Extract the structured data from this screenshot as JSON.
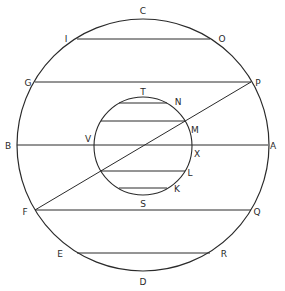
{
  "figure": {
    "outer_circle": {
      "cx": 143,
      "cy": 145,
      "r": 126
    },
    "inner_circle": {
      "cx": 143,
      "cy": 146,
      "r": 49
    },
    "stroke_color": "#2a2a2a",
    "chords": [
      {
        "name": "chord-IO",
        "x1": 77,
        "y1": 39,
        "x2": 210,
        "y2": 39
      },
      {
        "name": "chord-GP",
        "x1": 35,
        "y1": 82,
        "x2": 251,
        "y2": 82
      },
      {
        "name": "diameter-BA",
        "x1": 17,
        "y1": 145,
        "x2": 268,
        "y2": 145
      },
      {
        "name": "chord-FQ",
        "x1": 35,
        "y1": 210,
        "x2": 251,
        "y2": 210
      },
      {
        "name": "chord-ER",
        "x1": 77,
        "y1": 253,
        "x2": 210,
        "y2": 253
      },
      {
        "name": "inner-chord-TN",
        "x1": 119,
        "y1": 103,
        "x2": 167,
        "y2": 103
      },
      {
        "name": "inner-chord-M",
        "x1": 101,
        "y1": 121,
        "x2": 185,
        "y2": 121
      },
      {
        "name": "inner-chord-L",
        "x1": 101,
        "y1": 171,
        "x2": 185,
        "y2": 171
      },
      {
        "name": "inner-chord-SK",
        "x1": 119,
        "y1": 188,
        "x2": 167,
        "y2": 188
      }
    ],
    "diagonal": {
      "name": "line-FP",
      "x1": 35,
      "y1": 210,
      "x2": 251,
      "y2": 82
    },
    "labels": [
      {
        "id": "C",
        "text": "C",
        "x": 143,
        "y": 14
      },
      {
        "id": "I",
        "text": "I",
        "x": 66,
        "y": 42
      },
      {
        "id": "O",
        "text": "O",
        "x": 222,
        "y": 42
      },
      {
        "id": "G",
        "text": "G",
        "x": 28,
        "y": 86
      },
      {
        "id": "P",
        "text": "P",
        "x": 258,
        "y": 86
      },
      {
        "id": "T",
        "text": "T",
        "x": 143,
        "y": 95
      },
      {
        "id": "N",
        "text": "N",
        "x": 178,
        "y": 105
      },
      {
        "id": "M",
        "text": "M",
        "x": 195,
        "y": 133
      },
      {
        "id": "V",
        "text": "V",
        "x": 88,
        "y": 142
      },
      {
        "id": "B",
        "text": "B",
        "x": 8,
        "y": 149
      },
      {
        "id": "A",
        "text": "A",
        "x": 273,
        "y": 149
      },
      {
        "id": "X",
        "text": "X",
        "x": 197,
        "y": 157
      },
      {
        "id": "L",
        "text": "L",
        "x": 190,
        "y": 176
      },
      {
        "id": "K",
        "text": "K",
        "x": 177,
        "y": 192
      },
      {
        "id": "S",
        "text": "S",
        "x": 143,
        "y": 207
      },
      {
        "id": "F",
        "text": "F",
        "x": 25,
        "y": 215
      },
      {
        "id": "Q",
        "text": "Q",
        "x": 257,
        "y": 215
      },
      {
        "id": "E",
        "text": "E",
        "x": 60,
        "y": 257
      },
      {
        "id": "R",
        "text": "R",
        "x": 224,
        "y": 257
      },
      {
        "id": "D",
        "text": "D",
        "x": 143,
        "y": 285
      }
    ]
  }
}
